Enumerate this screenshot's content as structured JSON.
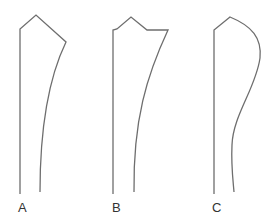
{
  "figure": {
    "type": "pattern-outline-comparison",
    "stroke_color": "#6e6e6e",
    "text_color": "#333333",
    "panels": [
      {
        "label": "A",
        "description": "Pointed top with single peak; right edge curves concavely down to narrow base",
        "path": "M20,194 L20,29 L36,15 L66,42 C50,75 40,120 40,192",
        "label_pos": {
          "x": 18,
          "y": 201
        }
      },
      {
        "label": "B",
        "description": "Top with small step, peak, and flat shoulder; right edge curves concavely down to base",
        "path": "M113,194 L113,30 L117,29 L131,17 L147,30 L168,30 C147,75 133,120 134,192",
        "label_pos": {
          "x": 112,
          "y": 201
        }
      },
      {
        "label": "C",
        "description": "Peaked top with rounded convex bulge on right; S-curve narrowing to base",
        "path": "M214,194 L214,30 L230,17 C252,26 262,38 260,58 C256,88 233,115 232,145 C231,165 233,180 234,192",
        "label_pos": {
          "x": 212,
          "y": 201
        }
      }
    ]
  }
}
